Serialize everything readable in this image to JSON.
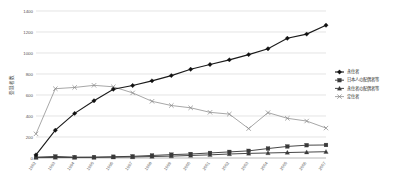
{
  "chart_data": {
    "type": "line",
    "title": "",
    "xlabel": "",
    "ylabel": "登録者数",
    "ylim": [
      0,
      1400
    ],
    "ytick_values": [
      0,
      200,
      400,
      600,
      800,
      1000,
      1200,
      1400
    ],
    "ytick_labels": [
      "0",
      "200",
      "400",
      "600",
      "800",
      "1000",
      "1200",
      "1400"
    ],
    "grid": true,
    "legend_position": "right",
    "categories": [
      "1992",
      "1993",
      "1994",
      "1995",
      "1996",
      "1997",
      "1998",
      "1999",
      "2000",
      "2001",
      "2002",
      "2003",
      "2004",
      "2005",
      "2006",
      "2007"
    ],
    "series": [
      {
        "name": "永住者",
        "marker": "diamond",
        "values": [
          30,
          265,
          425,
          545,
          655,
          690,
          735,
          785,
          845,
          890,
          935,
          985,
          1040,
          1140,
          1180,
          1265
        ]
      },
      {
        "name": "日本人の配偶者等",
        "marker": "square",
        "values": [
          8,
          15,
          8,
          8,
          12,
          16,
          24,
          32,
          38,
          48,
          58,
          68,
          90,
          110,
          122,
          124
        ]
      },
      {
        "name": "永住者の配偶者等",
        "marker": "triangle",
        "values": [
          4,
          5,
          5,
          6,
          8,
          10,
          14,
          18,
          24,
          30,
          38,
          44,
          48,
          52,
          56,
          60
        ]
      },
      {
        "name": "定住者",
        "marker": "cross",
        "values": [
          230,
          660,
          672,
          692,
          678,
          620,
          540,
          500,
          478,
          435,
          418,
          280,
          432,
          378,
          352,
          285
        ]
      }
    ],
    "last_point": {
      "永住者": 1310,
      "日本人の配偶者等": 148,
      "永住者の配偶者等": 68,
      "定住者": 268
    }
  }
}
